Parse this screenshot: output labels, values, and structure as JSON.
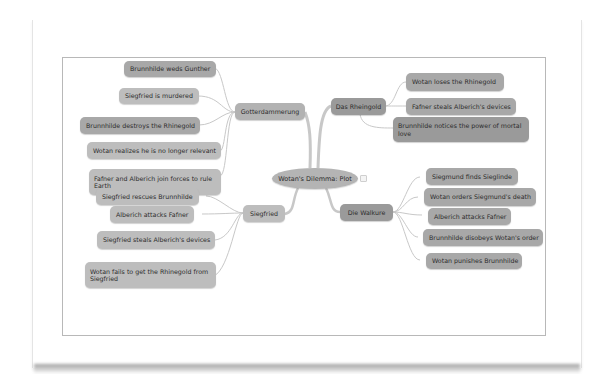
{
  "mindmap": {
    "center": {
      "label": "Wotan's Dilemma: Plot"
    },
    "branches": [
      {
        "label": "Gotterdammerung",
        "side": "left",
        "children": [
          {
            "label": "Brunnhilde weds Gunther"
          },
          {
            "label": "Siegfried is murdered"
          },
          {
            "label": "Brunnhilde destroys the Rhinegold"
          },
          {
            "label": "Wotan realizes he is no longer relevant"
          },
          {
            "label": "Fafner and Alberich join forces to rule Earth"
          }
        ]
      },
      {
        "label": "Das Rheingold",
        "side": "right",
        "children": [
          {
            "label": "Wotan loses the Rhinegold"
          },
          {
            "label": "Fafner steals Alberich's devices"
          },
          {
            "label": "Brunnhilde notices the power of mortal love"
          }
        ]
      },
      {
        "label": "Siegfried",
        "side": "left",
        "children": [
          {
            "label": "Siegfried rescues Brunnhilde"
          },
          {
            "label": "Alberich attacks Fafner"
          },
          {
            "label": "Siegfried steals Alberich's devices"
          },
          {
            "label": "Wotan fails to get the Rhinegold from Siegfried"
          }
        ]
      },
      {
        "label": "Die Walkure",
        "side": "right",
        "children": [
          {
            "label": "Siegmund finds Sieglinde"
          },
          {
            "label": "Wotan orders Siegmund's death"
          },
          {
            "label": "Alberich attacks Fafner"
          },
          {
            "label": "Brunnhilde disobeys Wotan's order"
          },
          {
            "label": "Wotan punishes Brunnhilde"
          }
        ]
      }
    ]
  },
  "colors": {
    "node_fill": "#a8a8a8",
    "center_fill": "#b4b4b4",
    "link_stroke": "#c4c4c4",
    "frame_border": "#b8b8b8",
    "text": "#2c2c2c"
  }
}
